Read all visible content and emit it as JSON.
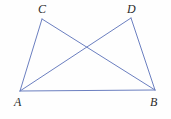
{
  "figure": {
    "kind": "geometry-diagram",
    "background_color": "#fefefe",
    "stroke_color": "#6b7fc0",
    "label_color": "#2b2b2b",
    "stroke_width": 1,
    "points": {
      "A": {
        "label": "A",
        "x": 20,
        "y": 91
      },
      "B": {
        "label": "B",
        "x": 155,
        "y": 90
      },
      "C": {
        "label": "C",
        "x": 42,
        "y": 19
      },
      "D": {
        "label": "D",
        "x": 131,
        "y": 18
      }
    },
    "segments": [
      {
        "name": "AB",
        "from": "A",
        "to": "B"
      },
      {
        "name": "AC",
        "from": "A",
        "to": "C"
      },
      {
        "name": "AD",
        "from": "A",
        "to": "D"
      },
      {
        "name": "CB",
        "from": "C",
        "to": "B"
      },
      {
        "name": "DB",
        "from": "D",
        "to": "B"
      }
    ],
    "intersection": {
      "name": "AD-CB-crossing",
      "x": 88,
      "y": 48
    }
  }
}
